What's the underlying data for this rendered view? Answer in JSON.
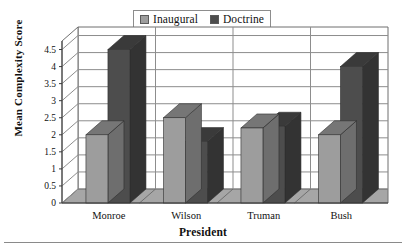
{
  "legend": {
    "entries": [
      {
        "label": "Inaugural",
        "color": "#9d9d9d",
        "swatch_name": "legend-swatch-inaugural"
      },
      {
        "label": "Doctrine",
        "color": "#4d4d4d",
        "swatch_name": "legend-swatch-doctrine"
      }
    ]
  },
  "axes": {
    "y_title": "Mean Complexity Score",
    "x_title": "President",
    "y_ticks": [
      "0",
      "0.5",
      "1",
      "1.5",
      "2",
      "2.5",
      "3",
      "3.5",
      "4",
      "4.5"
    ]
  },
  "chart_data": {
    "type": "bar",
    "title": "",
    "subtitle": "",
    "xlabel": "President",
    "ylabel": "Mean Complexity Score",
    "categories": [
      "Monroe",
      "Wilson",
      "Truman",
      "Bush"
    ],
    "series": [
      {
        "name": "Inaugural",
        "color": "#9d9d9d",
        "values": [
          2.0,
          2.5,
          2.2,
          2.0
        ]
      },
      {
        "name": "Doctrine",
        "color": "#4d4d4d",
        "values": [
          4.5,
          1.8,
          2.25,
          4.0
        ]
      }
    ],
    "ylim": [
      0,
      4.75
    ],
    "ytick_step": 0.5,
    "grid": true,
    "grid_axis": "y",
    "legend_position": "top-center",
    "style": "3d-column",
    "annotations": []
  },
  "colors": {
    "bar_inaugural_front": "#9d9d9d",
    "bar_inaugural_top": "#767676",
    "bar_inaugural_side": "#6e6e6e",
    "bar_doctrine_front": "#4d4d4d",
    "bar_doctrine_top": "#3a3a3a",
    "bar_doctrine_side": "#333333",
    "floor": "#a6a6a6",
    "wall_back": "#ffffff",
    "wall_side": "#ffffff",
    "gridline": "#8d8d8d",
    "frame": "#6f6f6f"
  }
}
